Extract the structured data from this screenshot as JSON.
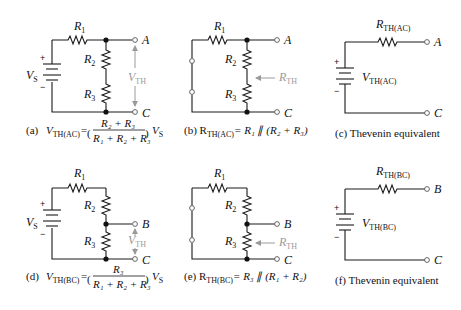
{
  "figure": {
    "panels": [
      {
        "id": "a",
        "caption_prefix": "(a)",
        "caption_lhs": "V",
        "caption_lhs_sub": "TH(AC)",
        "caption_eq": "=",
        "caption_numerator": "R₂ + R₃",
        "caption_denominator": "R₁ + R₂ + R₃",
        "caption_tail": "V",
        "caption_tail_sub": "S",
        "labels": {
          "r1": "R",
          "r1_sub": "1",
          "r2": "R",
          "r2_sub": "2",
          "r3": "R",
          "r3_sub": "3",
          "vs": "V",
          "vs_sub": "S",
          "plus": "+",
          "minus": "−",
          "term_top": "A",
          "term_bottom": "C",
          "vth": "V",
          "vth_sub": "TH"
        }
      },
      {
        "id": "b",
        "caption": "(b) R",
        "caption_sub": "TH(AC)",
        "caption_rest": "= R₁ ∥ (R₂ + R₃)",
        "labels": {
          "r1": "R",
          "r1_sub": "1",
          "r2": "R",
          "r2_sub": "2",
          "r3": "R",
          "r3_sub": "3",
          "term_top": "A",
          "term_bottom": "C",
          "rth": "R",
          "rth_sub": "TH"
        }
      },
      {
        "id": "c",
        "caption": "(c) Thevenin equivalent",
        "labels": {
          "rth": "R",
          "rth_sub": "TH(AC)",
          "vth": "V",
          "vth_sub": "TH(AC)",
          "plus": "+",
          "minus": "−",
          "term_top": "A",
          "term_bottom": "C"
        }
      },
      {
        "id": "d",
        "caption_prefix": "(d)",
        "caption_lhs": "V",
        "caption_lhs_sub": "TH(BC)",
        "caption_eq": "=",
        "caption_numerator": "R₃",
        "caption_denominator": "R₁ + R₂ + R₃",
        "caption_tail": "V",
        "caption_tail_sub": "S",
        "labels": {
          "r1": "R",
          "r1_sub": "1",
          "r2": "R",
          "r2_sub": "2",
          "r3": "R",
          "r3_sub": "3",
          "vs": "V",
          "vs_sub": "S",
          "plus": "+",
          "minus": "−",
          "term_top": "B",
          "term_bottom": "C",
          "vth": "V",
          "vth_sub": "TH"
        }
      },
      {
        "id": "e",
        "caption": "(e) R",
        "caption_sub": "TH(BC)",
        "caption_rest": "= R₃ ∥ (R₁ + R₂)",
        "labels": {
          "r1": "R",
          "r1_sub": "1",
          "r2": "R",
          "r2_sub": "2",
          "r3": "R",
          "r3_sub": "3",
          "term_top": "B",
          "term_bottom": "C",
          "rth": "R",
          "rth_sub": "TH"
        }
      },
      {
        "id": "f",
        "caption": "(f) Thevenin equivalent",
        "labels": {
          "rth": "R",
          "rth_sub": "TH(BC)",
          "vth": "V",
          "vth_sub": "TH(BC)",
          "plus": "+",
          "minus": "−",
          "term_top": "B",
          "term_bottom": "C"
        }
      }
    ],
    "colors": {
      "wire": "#1a1a1a",
      "annotation": "#9a9a9a"
    }
  }
}
